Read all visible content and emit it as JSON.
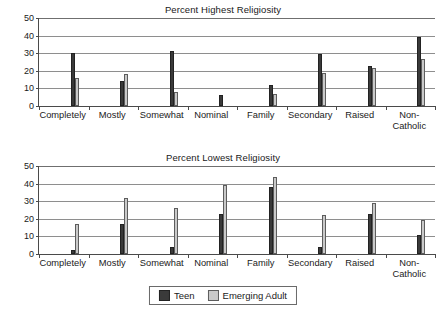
{
  "chart_data": [
    {
      "type": "bar",
      "title": "Percent Highest Religiosity",
      "xlabel": "",
      "ylabel": "",
      "ylim": [
        0,
        50
      ],
      "yticks": [
        0,
        10,
        20,
        30,
        40,
        50
      ],
      "grid": true,
      "legend_position": "bottom-shared",
      "categories": [
        "Completely",
        "Mostly",
        "Somewhat",
        "Nominal",
        "Family",
        "Secondary",
        "Raised",
        "Non-Catholic"
      ],
      "series": [
        {
          "name": "Teen",
          "color": "#3a3a3a",
          "values": [
            30,
            14,
            31,
            6,
            12,
            29.5,
            22.5,
            39
          ]
        },
        {
          "name": "Emerging Adult",
          "color": "#c9c9c9",
          "values": [
            16,
            18,
            8,
            0,
            7,
            19,
            21.5,
            26.5
          ]
        }
      ]
    },
    {
      "type": "bar",
      "title": "Percent Lowest Religiosity",
      "xlabel": "",
      "ylabel": "",
      "ylim": [
        0,
        50
      ],
      "yticks": [
        0,
        10,
        20,
        30,
        40,
        50
      ],
      "grid": true,
      "legend_position": "bottom-shared",
      "categories": [
        "Completely",
        "Mostly",
        "Somewhat",
        "Nominal",
        "Family",
        "Secondary",
        "Raised",
        "Non-Catholic"
      ],
      "series": [
        {
          "name": "Teen",
          "color": "#3a3a3a",
          "values": [
            2,
            17,
            4,
            23,
            38,
            4,
            23,
            11
          ]
        },
        {
          "name": "Emerging Adult",
          "color": "#c9c9c9",
          "values": [
            17,
            32,
            26,
            39,
            44,
            22,
            29,
            19.5
          ]
        }
      ]
    }
  ],
  "legend": {
    "items": [
      {
        "label": "Teen",
        "color": "#3a3a3a"
      },
      {
        "label": "Emerging Adult",
        "color": "#c9c9c9"
      }
    ]
  },
  "category_labels": [
    {
      "line1": "Completely",
      "line2": ""
    },
    {
      "line1": "Mostly",
      "line2": ""
    },
    {
      "line1": "Somewhat",
      "line2": ""
    },
    {
      "line1": "Nominal",
      "line2": ""
    },
    {
      "line1": "Family",
      "line2": ""
    },
    {
      "line1": "Secondary",
      "line2": ""
    },
    {
      "line1": "Raised",
      "line2": ""
    },
    {
      "line1": "Non-",
      "line2": "Catholic"
    }
  ]
}
